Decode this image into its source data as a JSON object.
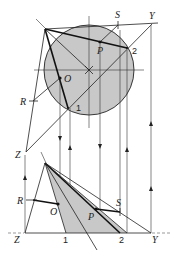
{
  "diagram": {
    "fill_color": "#c8c8c8",
    "line_color": "#222222",
    "labels": {
      "S_top": "S",
      "Y_top": "Y",
      "P_top": "P",
      "two_top": "2",
      "O_top": "O",
      "R_top": "R",
      "one_top": "1",
      "Z_mid": "Z",
      "R_bottom": "R",
      "O_bottom": "O",
      "P_bottom": "P",
      "S_bottom": "S",
      "Z_bottom": "Z",
      "one_bottom": "1",
      "two_bottom": "2",
      "Y_bottom": "Y"
    }
  }
}
